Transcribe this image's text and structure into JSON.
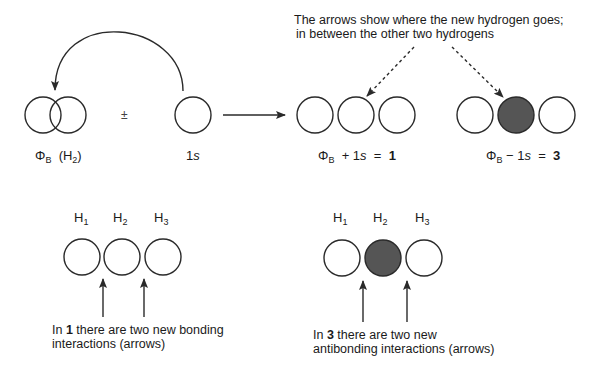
{
  "colors": {
    "stroke": "#2a2a2a",
    "filled_orbital": "#555555",
    "background": "#ffffff"
  },
  "top_note": {
    "line1": "The arrows show where the new hydrogen goes;",
    "line2": "in between the other two hydrogens"
  },
  "row1": {
    "phi_b_label": {
      "phi": "Φ",
      "sub": "B",
      "paren_open": "(H",
      "h_sub": "2",
      "paren_close": ")"
    },
    "plus_minus": "±",
    "one_s_label": {
      "num": "1",
      "s": "s"
    },
    "combo1": {
      "phi": "Φ",
      "sub": "B",
      "op": "+ 1",
      "s": "s",
      "eq": "=",
      "result": "1"
    },
    "combo3": {
      "phi": "Φ",
      "sub": "B",
      "op": "− 1",
      "s": "s",
      "eq": "=",
      "result": "3"
    }
  },
  "row2": {
    "left": {
      "labels": [
        {
          "h": "H",
          "sub": "1"
        },
        {
          "h": "H",
          "sub": "2"
        },
        {
          "h": "H",
          "sub": "3"
        }
      ],
      "caption_pre": "In ",
      "caption_bold": "1",
      "caption_line1_rest": " there are two new bonding",
      "caption_line2": "interactions (arrows)"
    },
    "right": {
      "labels": [
        {
          "h": "H",
          "sub": "1"
        },
        {
          "h": "H",
          "sub": "2"
        },
        {
          "h": "H",
          "sub": "3"
        }
      ],
      "caption_pre": "In ",
      "caption_bold": "3",
      "caption_line1_rest": " there are two new",
      "caption_line2": "antibonding interactions (arrows)"
    }
  }
}
